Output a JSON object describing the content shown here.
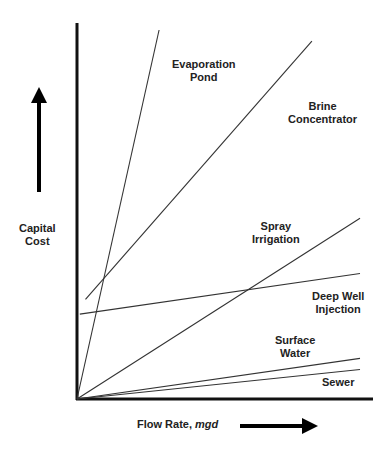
{
  "chart_data": {
    "type": "line",
    "title": "",
    "xlabel": "Flow Rate, mgd",
    "xlabel_main": "Flow Rate,",
    "xlabel_unit": "mgd",
    "ylabel": "Capital Cost",
    "ylabel_line1": "Capital",
    "ylabel_line2": "Cost",
    "grid": false,
    "legend": "inline labels",
    "axis_ticks": "none (qualitative)",
    "xlim": [
      0,
      100
    ],
    "ylim": [
      0,
      100
    ],
    "series": [
      {
        "name": "Evaporation Pond",
        "label_line1": "Evaporation",
        "label_line2": "Pond",
        "x": [
          0,
          29
        ],
        "y": [
          0,
          100
        ]
      },
      {
        "name": "Brine Concentrator",
        "label_line1": "Brine",
        "label_line2": "Concentrator",
        "x": [
          3,
          83
        ],
        "y": [
          27,
          97
        ]
      },
      {
        "name": "Spray Irrigation",
        "label_line1": "Spray",
        "label_line2": "Irrigation",
        "x": [
          0,
          100
        ],
        "y": [
          0,
          49
        ]
      },
      {
        "name": "Deep Well Injection",
        "label_line1": "Deep Well",
        "label_line2": "Injection",
        "x": [
          1,
          100
        ],
        "y": [
          23,
          34
        ]
      },
      {
        "name": "Surface Water",
        "label_line1": "Surface",
        "label_line2": "Water",
        "x": [
          0,
          100
        ],
        "y": [
          0,
          11
        ]
      },
      {
        "name": "Sewer",
        "label_line1": "Sewer",
        "label_line2": "",
        "x": [
          0,
          100
        ],
        "y": [
          0,
          8
        ]
      }
    ]
  }
}
